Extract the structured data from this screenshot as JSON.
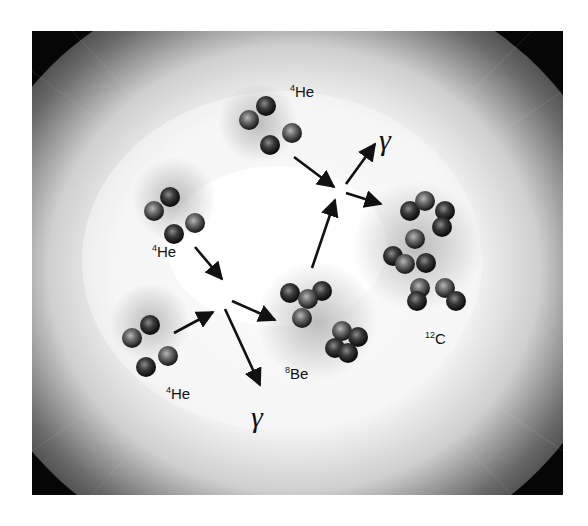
{
  "diagram": {
    "type": "triple-alpha process illustration",
    "colors": {
      "background_white": "#ffffff",
      "dark_space": "#050505",
      "glow_core": "#ffffff",
      "nucleon_dark": "#1a1a1a",
      "nucleon_light": "#8a8a8a",
      "arrow": "#111111"
    },
    "labels": {
      "he4_top": {
        "sup": "4",
        "text": "He"
      },
      "he4_left": {
        "sup": "4",
        "text": "He"
      },
      "he4_bottom": {
        "sup": "4",
        "text": "He"
      },
      "be8": {
        "sup": "8",
        "text": "Be"
      },
      "c12": {
        "sup": "12",
        "text": "C"
      },
      "gamma_top": "γ",
      "gamma_bottom": "γ"
    },
    "nodes": [
      {
        "id": "he4_top",
        "label": "4He",
        "nucleons": 4
      },
      {
        "id": "he4_left",
        "label": "4He",
        "nucleons": 4
      },
      {
        "id": "he4_bottom",
        "label": "4He",
        "nucleons": 4
      },
      {
        "id": "be8",
        "label": "8Be",
        "nucleons": 8
      },
      {
        "id": "c12",
        "label": "12C",
        "nucleons": 12
      },
      {
        "id": "gamma_top",
        "label": "γ"
      },
      {
        "id": "gamma_bottom",
        "label": "γ"
      }
    ],
    "edges": [
      {
        "from": "he4_left",
        "to": "vertex1"
      },
      {
        "from": "he4_bottom",
        "to": "vertex1"
      },
      {
        "from": "vertex1",
        "to": "be8"
      },
      {
        "from": "vertex1",
        "to": "gamma_bottom"
      },
      {
        "from": "be8",
        "to": "vertex2"
      },
      {
        "from": "he4_top",
        "to": "vertex2"
      },
      {
        "from": "vertex2",
        "to": "c12"
      },
      {
        "from": "vertex2",
        "to": "gamma_top"
      }
    ]
  }
}
